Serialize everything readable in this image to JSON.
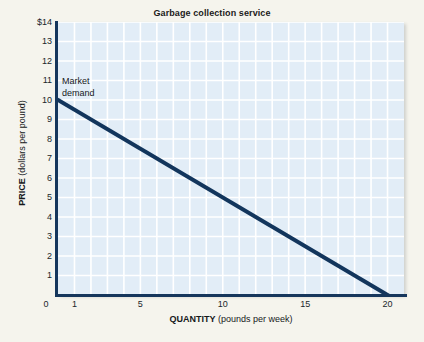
{
  "figure": {
    "background_color": "#f5f4ed",
    "plot_background_color": "#e2edf7",
    "grid_color": "#ffffff",
    "axis_color": "#15365c",
    "series_color": "#12355c"
  },
  "chart_data": {
    "type": "line",
    "title": "Garbage collection service",
    "xlabel_bold": "QUANTITY",
    "xlabel_detail": "(pounds per week)",
    "ylabel_bold": "PRICE",
    "ylabel_detail": "(dollars per pound)",
    "xlim": [
      0,
      21
    ],
    "ylim": [
      0,
      14
    ],
    "xticks": [
      0,
      1,
      5,
      10,
      15,
      20
    ],
    "xtick_labels": [
      "0",
      "1",
      "5",
      "10",
      "15",
      "20"
    ],
    "yticks": [
      1,
      2,
      3,
      4,
      5,
      6,
      7,
      8,
      9,
      10,
      11,
      12,
      13,
      14
    ],
    "ytick_labels": [
      "1",
      "2",
      "3",
      "4",
      "5",
      "6",
      "7",
      "8",
      "9",
      "10",
      "11",
      "12",
      "13",
      "$14"
    ],
    "grid": true,
    "grid_x_step": 1,
    "grid_y_step": 1,
    "legend": "none",
    "series": [
      {
        "name": "Market demand",
        "type": "line",
        "x": [
          0,
          20
        ],
        "y": [
          10,
          0
        ],
        "color": "#12355c",
        "width": 4,
        "points": [
          {
            "x": 0,
            "y": 10
          },
          {
            "x": 2,
            "y": 9
          },
          {
            "x": 4,
            "y": 8
          },
          {
            "x": 6,
            "y": 7
          },
          {
            "x": 8,
            "y": 6
          },
          {
            "x": 10,
            "y": 5
          },
          {
            "x": 12,
            "y": 4
          },
          {
            "x": 14,
            "y": 3
          },
          {
            "x": 16,
            "y": 2
          },
          {
            "x": 18,
            "y": 1
          },
          {
            "x": 20,
            "y": 0
          }
        ]
      }
    ],
    "annotations": [
      {
        "name": "market-demand-label",
        "text": "Market\ndemand",
        "x": 0.3,
        "y": 11.3
      }
    ]
  }
}
